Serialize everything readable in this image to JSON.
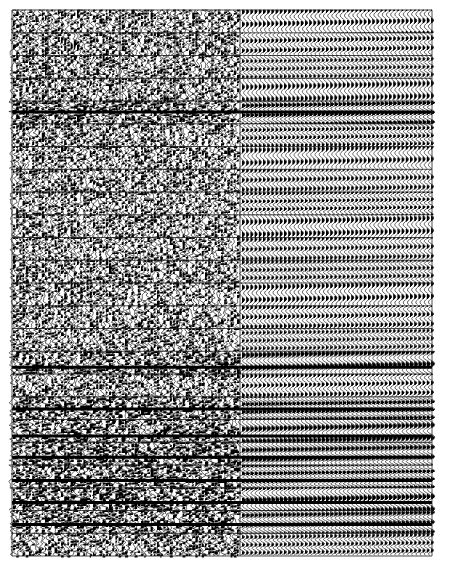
{
  "chart_data": {
    "type": "wiggle-trace",
    "title": "",
    "xlabel": "",
    "ylabel": "",
    "frame": {
      "x0": 12,
      "y0": 10,
      "x1": 432,
      "y1": 556
    },
    "split_x": 240,
    "bands": 24,
    "band_height_px": 22.75,
    "left_section": {
      "description": "noisy / incoherent wiggle traces",
      "trace_spacing_px": 3.2,
      "amplitude_px": 3.2,
      "vertical_grid_x": [
        48,
        120,
        175,
        212
      ],
      "vertical_grid_bands": [
        0,
        1,
        2,
        3,
        4,
        5,
        6,
        7,
        8,
        9,
        10,
        11,
        12,
        13,
        14,
        15,
        16,
        17,
        18,
        19,
        20,
        21,
        22,
        23
      ]
    },
    "right_section": {
      "description": "regular periodic wiggle traces",
      "trace_spacing_px": 4.2,
      "amplitude_px": 2.6
    },
    "heavy_bands": [
      4,
      15,
      17,
      18,
      19,
      20,
      21,
      22
    ],
    "colors": {
      "ink": "#000000",
      "paper": "#ffffff",
      "grid": "#222222"
    }
  },
  "labels": {
    "plot_name": "Seismic wiggle trace panel"
  }
}
